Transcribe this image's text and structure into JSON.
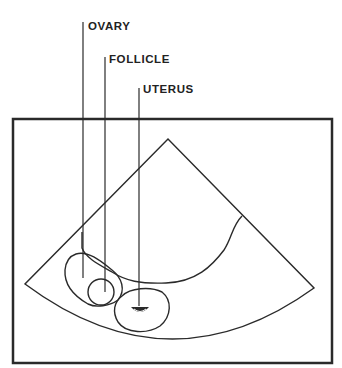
{
  "diagram": {
    "type": "ultrasound-sector-schematic",
    "labels": [
      {
        "id": "ovary",
        "text": "OVARY"
      },
      {
        "id": "follicle",
        "text": "FOLLICLE"
      },
      {
        "id": "uterus",
        "text": "UTERUS"
      }
    ],
    "colors": {
      "ink": "#2a2a2a",
      "background": "#ffffff"
    }
  }
}
